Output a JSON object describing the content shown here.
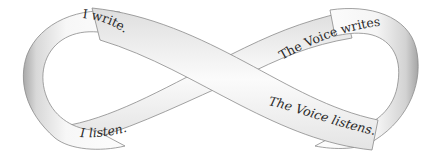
{
  "diagram": {
    "type": "infinity-ribbon",
    "colors": {
      "background": "#ffffff",
      "ribbon_light": "#fbfbfb",
      "ribbon_shade": "#cfcfcf",
      "ribbon_edge": "#8a8a8a",
      "text": "#2a2a2a"
    },
    "labels": {
      "top_left": "I write.",
      "top_right": "The Voice writes.",
      "bottom_left": "I listen.",
      "bottom_right": "The Voice listens."
    }
  }
}
